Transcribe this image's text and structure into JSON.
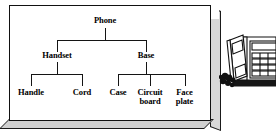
{
  "figure": {
    "type": "product-structure-tree",
    "title_node": "Phone",
    "box": {
      "style": "3d-beveled-panel",
      "face_color": "#ffffff",
      "edge_color": "#111111",
      "side_color": "#d8d8d8"
    },
    "illustration": {
      "name": "desk-telephone",
      "description": "line-art desk telephone with handset and keypad",
      "cropped_at_right_edge": true
    }
  },
  "tree": {
    "root": {
      "label": "Phone"
    },
    "level1": [
      {
        "label": "Handset"
      },
      {
        "label": "Base"
      }
    ],
    "level2": [
      {
        "label": "Handle",
        "parent": "Handset"
      },
      {
        "label": "Cord",
        "parent": "Handset"
      },
      {
        "label": "Case",
        "parent": "Base"
      },
      {
        "label": "Circuit board",
        "parent": "Base",
        "line1": "Circuit",
        "line2": "board"
      },
      {
        "label": "Face plate",
        "parent": "Base",
        "line1": "Face",
        "line2": "plate"
      }
    ]
  },
  "colors": {
    "ink": "#141414",
    "panel": "#ffffff",
    "bevel": "#d8d8d8"
  }
}
